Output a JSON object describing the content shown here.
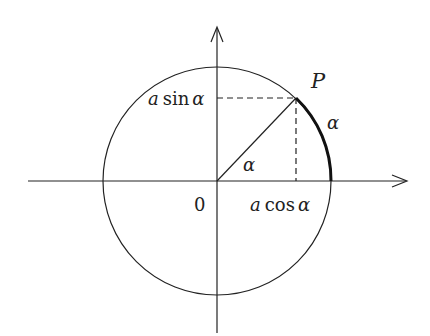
{
  "diagram": {
    "type": "unit-circle-trigonometry",
    "stroke_color": "#222222",
    "background": "#ffffff",
    "labels": {
      "origin": "0",
      "point": "P",
      "sin_label_a": "a",
      "sin_label_fn": "sin",
      "sin_label_var": "α",
      "cos_label_a": "a",
      "cos_label_fn": "cos",
      "cos_label_var": "α",
      "angle": "α",
      "arc": "α"
    },
    "geometry": {
      "center": [
        217,
        181
      ],
      "radius": 114,
      "point_P": [
        296,
        98
      ],
      "x_axis": [
        28,
        407
      ],
      "y_axis": [
        27,
        333
      ]
    }
  }
}
